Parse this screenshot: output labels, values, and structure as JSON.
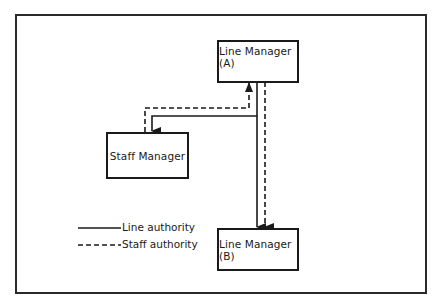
{
  "diagram": {
    "nodes": [
      {
        "id": "line_manager_a",
        "label": "Line Manager (A)"
      },
      {
        "id": "staff_manager",
        "label": "Staff Manager"
      },
      {
        "id": "line_manager_b",
        "label": "Line Manager (B)"
      }
    ],
    "edges": [
      {
        "from": "line_manager_a",
        "to": "staff_manager",
        "type": "line authority",
        "style": "solid"
      },
      {
        "from": "line_manager_a",
        "to": "staff_manager",
        "type": "staff authority",
        "style": "dashed"
      },
      {
        "from": "line_manager_a",
        "to": "line_manager_b",
        "type": "line authority",
        "style": "solid"
      },
      {
        "from": "line_manager_a",
        "to": "line_manager_b",
        "type": "staff authority",
        "style": "dashed"
      }
    ],
    "legend": [
      {
        "style": "solid",
        "label": "Line authority"
      },
      {
        "style": "dashed",
        "label": "Staff authority"
      }
    ]
  },
  "colors": {
    "ink": "#1a1a1a",
    "background": "#ffffff"
  }
}
